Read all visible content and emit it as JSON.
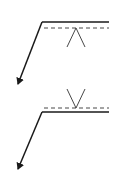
{
  "diagram": {
    "type": "welding-symbols",
    "stroke_color": "#1a1a1a",
    "symbols": [
      {
        "name": "fillet-weld-other-side",
        "reference_line": {
          "x1": 42,
          "x2": 109,
          "y": 22
        },
        "identification_line_dashed": {
          "x1": 44,
          "x2": 109,
          "y": 28
        },
        "weld_symbol": {
          "shape": "fillet-triangle",
          "apex": [
            76,
            28
          ],
          "legs": [
            [
              67,
              47
            ],
            [
              85,
              47
            ]
          ]
        },
        "arrow": {
          "from": [
            42,
            22
          ],
          "to": [
            17,
            86
          ]
        }
      },
      {
        "name": "fillet-weld-arrow-side",
        "reference_line": {
          "x1": 42,
          "x2": 109,
          "y": 112
        },
        "identification_line_dashed": {
          "x1": 44,
          "x2": 109,
          "y": 108
        },
        "weld_symbol": {
          "shape": "fillet-triangle",
          "apex": [
            76,
            108
          ],
          "legs": [
            [
              67,
              89
            ],
            [
              85,
              89
            ]
          ]
        },
        "arrow": {
          "from": [
            42,
            112
          ],
          "to": [
            17,
            171
          ]
        }
      }
    ]
  }
}
